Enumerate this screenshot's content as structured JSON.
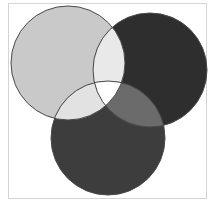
{
  "diagram": {
    "type": "venn",
    "sets": [
      {
        "id": "A",
        "position": "top-left",
        "cx": 68,
        "cy": 63,
        "r": 57,
        "fill": "#c9c9c9"
      },
      {
        "id": "B",
        "position": "top-right",
        "cx": 150,
        "cy": 70,
        "r": 57,
        "fill": "#2e2e2e"
      },
      {
        "id": "C",
        "position": "bottom",
        "cx": 108,
        "cy": 138,
        "r": 57,
        "fill": "#3d3d3d"
      }
    ],
    "intersections": {
      "AB": "#e9e9e9",
      "AC": "#e2e2e2",
      "BC": "#6b6b6b",
      "ABC": "#ffffff"
    },
    "stroke": "#4a4a4a",
    "frame_color": "#d4d4d4"
  }
}
